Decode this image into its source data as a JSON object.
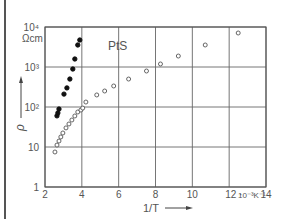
{
  "chart_data": {
    "type": "scatter",
    "title": "",
    "annotation": "PtS",
    "xlabel": "1/T",
    "ylabel": "ρ",
    "y_unit": "Ωcm",
    "x_unit_label": "10⁻³K⁻¹",
    "xlim": [
      2,
      14
    ],
    "ylim": [
      1,
      10000
    ],
    "yscale": "log",
    "grid": true,
    "x_ticks": [
      "2",
      "4",
      "6",
      "8",
      "10",
      "12",
      "14"
    ],
    "x_tick_values": [
      2,
      4,
      6,
      8,
      10,
      12,
      14
    ],
    "y_ticks": [
      "1",
      "10",
      "10²",
      "10³",
      "10⁴"
    ],
    "y_tick_values": [
      1,
      10,
      100,
      1000,
      10000
    ],
    "series": [
      {
        "name": "filled",
        "marker": "filled-circle",
        "x": [
          2.65,
          2.7,
          2.76,
          3.03,
          3.19,
          3.35,
          3.51,
          3.62,
          3.78,
          3.89
        ],
        "y": [
          60,
          71,
          89,
          210,
          300,
          500,
          890,
          1585,
          3550,
          4730
        ]
      },
      {
        "name": "open",
        "marker": "open-circle",
        "x": [
          2.54,
          2.65,
          2.76,
          2.86,
          2.97,
          3.14,
          3.3,
          3.46,
          3.62,
          3.78,
          3.95,
          4.05,
          4.22,
          4.81,
          5.24,
          5.73,
          6.54,
          7.51,
          8.27,
          9.24,
          10.7,
          12.49
        ],
        "y": [
          7.5,
          11.2,
          14.1,
          17.8,
          22.4,
          30,
          37.6,
          47.3,
          59.6,
          75,
          84,
          94,
          133,
          200,
          251,
          335,
          500,
          794,
          1190,
          1880,
          3550,
          7080
        ]
      }
    ]
  }
}
